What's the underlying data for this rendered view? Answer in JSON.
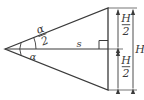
{
  "figure": {
    "type": "geometry-diagram",
    "width": 144,
    "height": 100,
    "background_color": "#ffffff",
    "line_color": "#3a3a3a",
    "label_color": "#3a3a3a"
  },
  "shape": {
    "name": "isosceles-triangle",
    "apex": {
      "x": 5,
      "y": 49
    },
    "top_vertex": {
      "x": 108,
      "y": 8
    },
    "bottom_vertex": {
      "x": 108,
      "y": 90
    },
    "axis_start": {
      "x": 5,
      "y": 49
    },
    "axis_end": {
      "x": 108,
      "y": 49
    }
  },
  "labels": {
    "half_angle": {
      "numerator": "α",
      "denominator": "2",
      "text": "α/2"
    },
    "full_angle": {
      "text": "α"
    },
    "axis_distance": {
      "text": "s"
    },
    "half_height_top": {
      "numerator": "H",
      "denominator": "2",
      "text": "H/2"
    },
    "half_height_bottom": {
      "numerator": "H",
      "denominator": "2",
      "text": "H/2"
    },
    "full_height": {
      "text": "H"
    }
  },
  "annotations": {
    "right_angle_marker": {
      "present": true,
      "x": 99,
      "y": 41,
      "size": 9
    },
    "angle_arc_half": {
      "present": true,
      "radius": 31
    },
    "angle_arc_full": {
      "present": true,
      "radius": 17
    },
    "dimension_line_half_height": {
      "x": 118
    },
    "dimension_line_full_height": {
      "x": 133
    }
  }
}
